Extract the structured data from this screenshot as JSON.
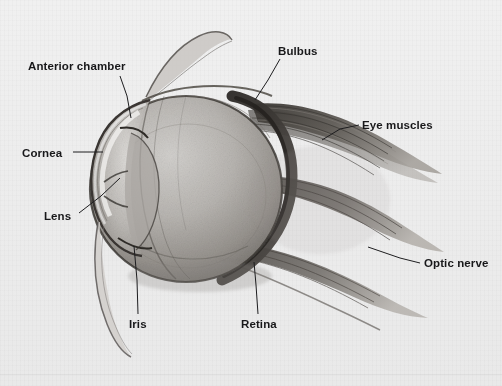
{
  "figure": {
    "background_color": "#ececec",
    "label_color": "#18181a",
    "leader_line_color": "#1d1d1f"
  },
  "labels": [
    {
      "id": "anterior-chamber",
      "text": "Anterior chamber",
      "x": 28,
      "y": 60
    },
    {
      "id": "bulbus",
      "text": "Bulbus",
      "x": 278,
      "y": 45
    },
    {
      "id": "eye-muscles",
      "text": "Eye muscles",
      "x": 362,
      "y": 119
    },
    {
      "id": "cornea",
      "text": "Cornea",
      "x": 22,
      "y": 147
    },
    {
      "id": "lens",
      "text": "Lens",
      "x": 44,
      "y": 210
    },
    {
      "id": "optic-nerve",
      "text": "Optic nerve",
      "x": 424,
      "y": 257
    },
    {
      "id": "iris",
      "text": "Iris",
      "x": 129,
      "y": 318
    },
    {
      "id": "retina",
      "text": "Retina",
      "x": 241,
      "y": 318
    }
  ],
  "leaders": [
    {
      "id": "leader-anterior-chamber",
      "points": "120,76 127,96 131,118"
    },
    {
      "id": "leader-bulbus",
      "points": "280,59 268,80 255,100"
    },
    {
      "id": "leader-eye-muscles",
      "points": "359,125 340,129 322,140"
    },
    {
      "id": "leader-cornea",
      "points": "73,152 103,152"
    },
    {
      "id": "leader-lens",
      "points": "79,213 101,196 120,178"
    },
    {
      "id": "leader-optic-nerve",
      "points": "420,263 400,258 368,247"
    },
    {
      "id": "leader-iris",
      "points": "138,314 137,280 134,246"
    },
    {
      "id": "leader-retina",
      "points": "258,314 256,285 254,262"
    }
  ]
}
